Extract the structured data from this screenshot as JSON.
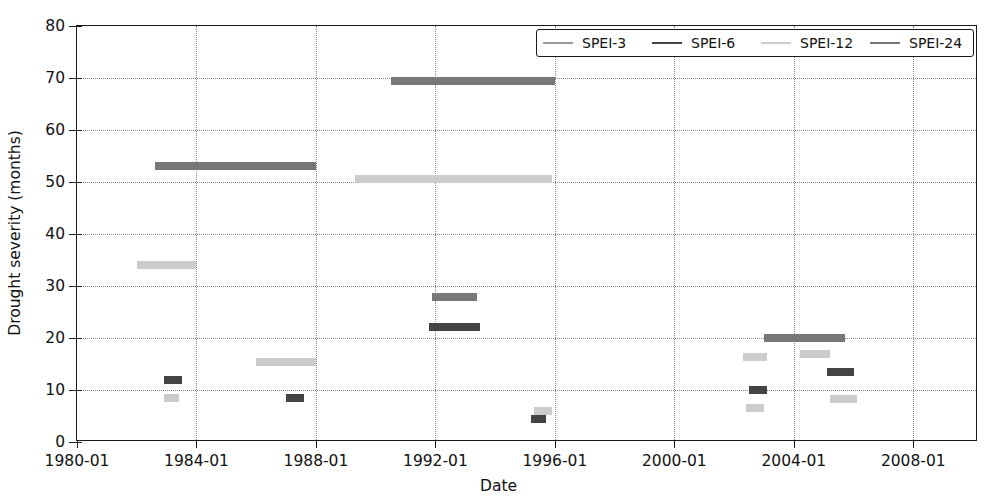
{
  "chart_data": {
    "type": "bar",
    "title": "",
    "xlabel": "Date",
    "ylabel": "Drought severity (months)",
    "ylim": [
      0,
      80
    ],
    "yticks": [
      0,
      10,
      20,
      30,
      40,
      50,
      60,
      70,
      80
    ],
    "xlim": [
      "1980-01",
      "2010-03"
    ],
    "xticks": [
      "1980-01",
      "1984-01",
      "1988-01",
      "1992-01",
      "1996-01",
      "2000-01",
      "2004-01",
      "2008-01"
    ],
    "grid": true,
    "legend_position": "upper right",
    "series": [
      {
        "name": "SPEI-3",
        "color": "#999999",
        "segments": []
      },
      {
        "name": "SPEI-6",
        "color": "#444444",
        "segments": [
          {
            "start": 1982.9,
            "end": 1983.5,
            "value": 12.0
          },
          {
            "start": 1987.0,
            "end": 1987.6,
            "value": 8.5
          },
          {
            "start": 1991.8,
            "end": 1993.5,
            "value": 22.2
          },
          {
            "start": 1995.2,
            "end": 1995.7,
            "value": 4.5
          },
          {
            "start": 2002.5,
            "end": 2003.1,
            "value": 10.0
          },
          {
            "start": 2005.1,
            "end": 2006.0,
            "value": 13.5
          }
        ]
      },
      {
        "name": "SPEI-12",
        "color": "#cccccc",
        "segments": [
          {
            "start": 1982.0,
            "end": 1984.0,
            "value": 34.0
          },
          {
            "start": 1982.9,
            "end": 1983.4,
            "value": 8.5
          },
          {
            "start": 1986.0,
            "end": 1988.0,
            "value": 15.3
          },
          {
            "start": 1989.3,
            "end": 1995.9,
            "value": 50.5
          },
          {
            "start": 1995.3,
            "end": 1995.9,
            "value": 6.0
          },
          {
            "start": 2002.3,
            "end": 2003.1,
            "value": 16.3
          },
          {
            "start": 2002.4,
            "end": 2003.0,
            "value": 6.6
          },
          {
            "start": 2004.2,
            "end": 2005.2,
            "value": 17.0
          },
          {
            "start": 2005.2,
            "end": 2006.1,
            "value": 8.2
          }
        ]
      },
      {
        "name": "SPEI-24",
        "color": "#777777",
        "segments": [
          {
            "start": 1982.6,
            "end": 1988.0,
            "value": 53.0
          },
          {
            "start": 1990.5,
            "end": 1996.0,
            "value": 69.5
          },
          {
            "start": 1991.9,
            "end": 1993.4,
            "value": 27.8
          },
          {
            "start": 2003.0,
            "end": 2005.7,
            "value": 20.0
          }
        ]
      }
    ]
  },
  "legend": {
    "items": [
      {
        "label": "SPEI-3",
        "color": "#999999"
      },
      {
        "label": "SPEI-6",
        "color": "#444444"
      },
      {
        "label": "SPEI-12",
        "color": "#cccccc"
      },
      {
        "label": "SPEI-24",
        "color": "#777777"
      }
    ]
  },
  "axes": {
    "y_title": "Drought severity (months)",
    "x_title": "Date"
  }
}
